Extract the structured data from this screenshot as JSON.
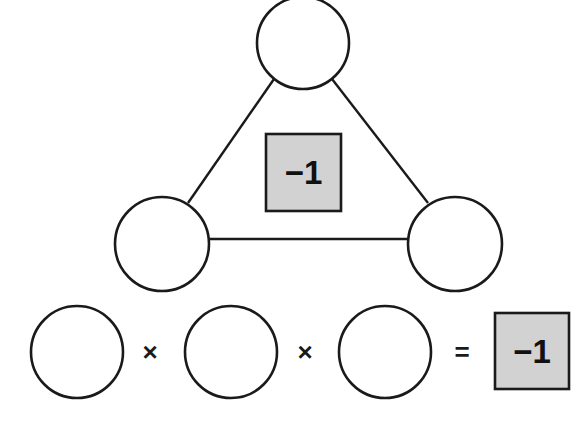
{
  "triangle": {
    "nodes": [
      {
        "id": "top",
        "value": "",
        "cx": 303,
        "cy": 43,
        "r": 46
      },
      {
        "id": "bottom-left",
        "value": "",
        "cx": 162,
        "cy": 244,
        "r": 47
      },
      {
        "id": "bottom-right",
        "value": "",
        "cx": 455,
        "cy": 244,
        "r": 47
      }
    ],
    "center_box": {
      "label": "−1",
      "x": 266,
      "y": 134,
      "width": 75,
      "height": 77,
      "fill": "#d2d2d2"
    }
  },
  "equation": {
    "factors": [
      {
        "id": "factor-1",
        "value": "",
        "cx": 77,
        "cy": 352,
        "r": 46
      },
      {
        "id": "factor-2",
        "value": "",
        "cx": 231,
        "cy": 352,
        "r": 46
      },
      {
        "id": "factor-3",
        "value": "",
        "cx": 385,
        "cy": 352,
        "r": 46
      }
    ],
    "operators": [
      "×",
      "×",
      "="
    ],
    "result_box": {
      "label": "−1",
      "x": 495,
      "y": 313,
      "width": 74,
      "height": 76,
      "fill": "#d2d2d2"
    }
  },
  "colors": {
    "stroke": "#1a1a1a",
    "box_fill": "#d2d2d2",
    "background": "#ffffff"
  }
}
